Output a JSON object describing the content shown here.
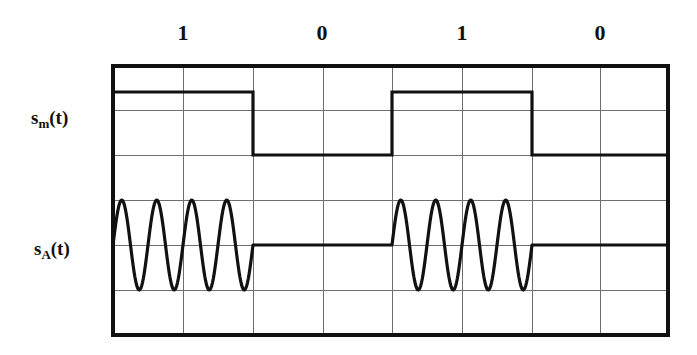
{
  "figure": {
    "title": "",
    "type": "waveform-timing-diagram",
    "background_color": "#ffffff",
    "ink_color": "#111111",
    "grid_color": "#6e6e6e",
    "signals": [
      {
        "id": "sm",
        "label_base": "s",
        "label_sub": "m",
        "label_tail": "(t)",
        "label_text": "s_m(t)",
        "description": "binary modulating signal"
      },
      {
        "id": "sa",
        "label_base": "s",
        "label_sub": "A",
        "label_tail": "(t)",
        "label_text": "s_A(t)",
        "description": "amplitude shift keyed carrier"
      }
    ],
    "bit_labels": [
      {
        "text": "1",
        "x": 183
      },
      {
        "text": "0",
        "x": 322
      },
      {
        "text": "1",
        "x": 462
      },
      {
        "text": "0",
        "x": 600
      }
    ],
    "grid": {
      "left": 113,
      "right": 668,
      "top": 66,
      "bottom": 335,
      "columns": 8,
      "rows": 6,
      "v_lines": [
        113,
        183,
        253,
        323,
        392,
        462,
        532,
        600,
        668
      ],
      "h_lines": [
        66,
        110,
        155,
        200,
        245,
        290,
        335
      ],
      "border_width": 3.2,
      "inner_width": 1.0
    },
    "chart_data": {
      "type": "line",
      "title": "",
      "xlabel": "",
      "ylabel": "",
      "bit_sequence": [
        1,
        0,
        1,
        0
      ],
      "bit_boundaries_px": [
        113,
        253,
        392,
        532,
        668
      ],
      "series": [
        {
          "name": "s_m(t)",
          "kind": "square",
          "high_y": 92,
          "low_y": 155,
          "segments": [
            {
              "bit": 1,
              "x0": 113,
              "x1": 253,
              "level": "high"
            },
            {
              "bit": 0,
              "x0": 253,
              "x1": 392,
              "level": "low"
            },
            {
              "bit": 1,
              "x0": 392,
              "x1": 532,
              "level": "high"
            },
            {
              "bit": 0,
              "x0": 532,
              "x1": 668,
              "level": "low"
            }
          ]
        },
        {
          "name": "s_A(t)",
          "kind": "ask-carrier",
          "baseline_y": 245,
          "amplitude_px": 45,
          "cycles_per_bit": 4,
          "segments": [
            {
              "bit": 1,
              "x0": 113,
              "x1": 253,
              "carrier": true
            },
            {
              "bit": 0,
              "x0": 253,
              "x1": 392,
              "carrier": false
            },
            {
              "bit": 1,
              "x0": 392,
              "x1": 532,
              "carrier": true
            },
            {
              "bit": 0,
              "x0": 532,
              "x1": 668,
              "carrier": false
            }
          ]
        }
      ]
    }
  }
}
